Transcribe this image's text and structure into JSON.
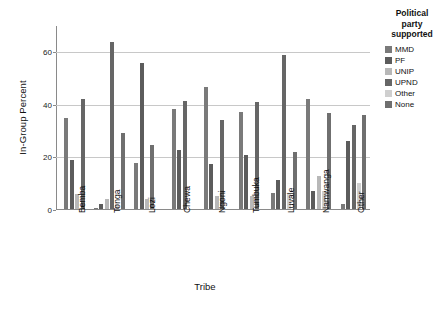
{
  "chart_data": {
    "type": "bar",
    "title": "",
    "xlabel": "Tribe",
    "ylabel": "In-Group Percent",
    "ylim": [
      0,
      70
    ],
    "yticks": [
      0,
      20,
      40,
      60
    ],
    "grid": true,
    "legend_position": "right",
    "legend_title": "Political party supported",
    "categories": [
      "Bemba",
      "Tonga",
      "Lozi",
      "Chewa",
      "Ngoni",
      "Tumbuka",
      "Luvale",
      "Namwanga",
      "Other"
    ],
    "series": [
      {
        "name": "MMD",
        "color": "#7a7a7a",
        "values": [
          34.5,
          0.4,
          17.5,
          38.0,
          46.5,
          37.0,
          6.0,
          42.0,
          2.0
        ]
      },
      {
        "name": "PF",
        "color": "#5c5c5c",
        "values": [
          18.8,
          2.0,
          55.5,
          22.3,
          17.3,
          20.6,
          11.2,
          7.0,
          25.8
        ]
      },
      {
        "name": "UNIP",
        "color": "#b8b8b8",
        "values": [
          5.6,
          4.0,
          4.0,
          0.3,
          4.8,
          4.8,
          1.0,
          12.7,
          0.4
        ]
      },
      {
        "name": "UPND",
        "color": "#666666",
        "values": [
          41.7,
          63.7,
          0.3,
          41.0,
          34.0,
          40.7,
          58.7,
          0.3,
          31.8
        ]
      },
      {
        "name": "Other",
        "color": "#cfcfcf",
        "values": [
          0.3,
          1.8,
          0.3,
          0.3,
          0.3,
          0.3,
          5.8,
          7.0,
          9.8
        ]
      },
      {
        "name": "None",
        "color": "#6f6f6f",
        "values": [
          0.3,
          28.8,
          24.3,
          0.3,
          0.3,
          0.3,
          21.8,
          36.5,
          35.6
        ]
      }
    ],
    "bar_groups": [
      {
        "category": "Bemba",
        "bars": [
          {
            "series": "MMD",
            "value": 34.5
          },
          {
            "series": "PF",
            "value": 18.8
          },
          {
            "series": "UNIP",
            "value": 5.6
          },
          {
            "series": "UPND",
            "value": 41.7
          }
        ]
      },
      {
        "category": "Tonga",
        "bars": [
          {
            "series": "MMD",
            "value": 0.4
          },
          {
            "series": "PF",
            "value": 2.0
          },
          {
            "series": "UNIP",
            "value": 4.0
          },
          {
            "series": "UPND",
            "value": 63.7
          },
          {
            "series": "Other",
            "value": 1.8
          },
          {
            "series": "None",
            "value": 28.8
          }
        ]
      },
      {
        "category": "Lozi",
        "bars": [
          {
            "series": "MMD",
            "value": 17.5
          },
          {
            "series": "PF",
            "value": 55.5
          },
          {
            "series": "UNIP",
            "value": 4.0
          },
          {
            "series": "None",
            "value": 24.3
          }
        ]
      },
      {
        "category": "Chewa",
        "bars": [
          {
            "series": "MMD",
            "value": 38.0
          },
          {
            "series": "PF",
            "value": 22.3
          },
          {
            "series": "UPND",
            "value": 41.0
          }
        ]
      },
      {
        "category": "Ngoni",
        "bars": [
          {
            "series": "MMD",
            "value": 46.5
          },
          {
            "series": "PF",
            "value": 17.3
          },
          {
            "series": "UNIP",
            "value": 4.8
          },
          {
            "series": "UPND",
            "value": 34.0
          }
        ]
      },
      {
        "category": "Tumbuka",
        "bars": [
          {
            "series": "MMD",
            "value": 37.0
          },
          {
            "series": "PF",
            "value": 20.6
          },
          {
            "series": "UNIP",
            "value": 4.8
          },
          {
            "series": "UPND",
            "value": 40.7
          }
        ]
      },
      {
        "category": "Luvale",
        "bars": [
          {
            "series": "MMD",
            "value": 6.0
          },
          {
            "series": "PF",
            "value": 11.2
          },
          {
            "series": "UPND",
            "value": 58.7
          },
          {
            "series": "Other",
            "value": 5.8
          },
          {
            "series": "None",
            "value": 21.8
          }
        ]
      },
      {
        "category": "Namwanga",
        "bars": [
          {
            "series": "MMD",
            "value": 42.0
          },
          {
            "series": "PF",
            "value": 7.0
          },
          {
            "series": "UNIP",
            "value": 12.7
          },
          {
            "series": "Other",
            "value": 7.0
          },
          {
            "series": "None",
            "value": 36.5
          }
        ]
      },
      {
        "category": "Other",
        "bars": [
          {
            "series": "MMD",
            "value": 2.0
          },
          {
            "series": "PF",
            "value": 25.8
          },
          {
            "series": "UPND",
            "value": 31.8
          },
          {
            "series": "Other",
            "value": 9.8
          },
          {
            "series": "None",
            "value": 35.6
          }
        ]
      }
    ]
  },
  "legend": {
    "title_line1": "Political",
    "title_line2": "party",
    "title_line3": "supported",
    "items": [
      {
        "label": "MMD",
        "color": "#7a7a7a"
      },
      {
        "label": "PF",
        "color": "#5c5c5c"
      },
      {
        "label": "UNIP",
        "color": "#b8b8b8"
      },
      {
        "label": "UPND",
        "color": "#666666"
      },
      {
        "label": "Other",
        "color": "#cfcfcf"
      },
      {
        "label": "None",
        "color": "#6f6f6f"
      }
    ]
  },
  "axes": {
    "y_title": "In-Group Percent",
    "x_title": "Tribe",
    "y_tick_labels": [
      "0",
      "20",
      "40",
      "60"
    ]
  }
}
